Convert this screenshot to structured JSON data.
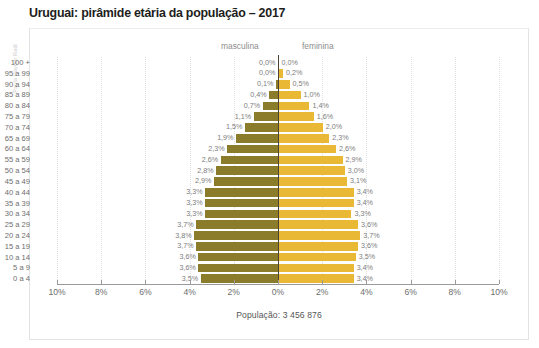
{
  "credit": "Paula Hayder Radi",
  "title": "Uruguai: pirâmide etária da população – 2017",
  "headers": {
    "male": "masculina",
    "female": "feminina"
  },
  "caption": "População: 3 456 876",
  "colors": {
    "male_bar": "#8a7c2b",
    "female_bar": "#e9b936",
    "centerline": "#4d4236",
    "axis": "#9a9a9a",
    "grid": "#e0e0e0",
    "title_text": "#1d1d1b",
    "label_text": "#6e6e6e"
  },
  "chart_data": {
    "type": "bar",
    "title": "Uruguai: pirâmide etária da população – 2017",
    "subtype": "population-pyramid",
    "xlabel": "",
    "ylabel": "",
    "xlim": [
      -10,
      10
    ],
    "grid": true,
    "legend_position": "top-center",
    "axis_ticks": [
      "10%",
      "8%",
      "6%",
      "4%",
      "2%",
      "0%",
      "2%",
      "4%",
      "6%",
      "8%",
      "10%"
    ],
    "axis_tick_values": [
      -10,
      -8,
      -6,
      -4,
      -2,
      0,
      2,
      4,
      6,
      8,
      10
    ],
    "categories": [
      "100 +",
      "95 a 99",
      "90 a 94",
      "85 a 89",
      "80 a 84",
      "75 a 79",
      "70 a 74",
      "65 a 69",
      "60 a 64",
      "55 a 59",
      "50 a 54",
      "45 a 49",
      "40 a 44",
      "35 a 39",
      "30 a 34",
      "25 a 29",
      "20 a 24",
      "15 a 19",
      "10 a 14",
      "5 a 9",
      "0 a 4"
    ],
    "series": [
      {
        "name": "masculina",
        "color": "#8a7c2b",
        "values": [
          0.0,
          0.0,
          0.1,
          0.4,
          0.7,
          1.1,
          1.5,
          1.9,
          2.3,
          2.6,
          2.8,
          2.9,
          3.3,
          3.3,
          3.3,
          3.7,
          3.8,
          3.7,
          3.6,
          3.6,
          3.5
        ],
        "labels": [
          "0,0%",
          "0,0%",
          "0,1%",
          "0,4%",
          "0,7%",
          "1,1%",
          "1,5%",
          "1,9%",
          "2,3%",
          "2,6%",
          "2,8%",
          "2,9%",
          "3,3%",
          "3,3%",
          "3,3%",
          "3,7%",
          "3,8%",
          "3,7%",
          "3,6%",
          "3,6%",
          "3,5%"
        ]
      },
      {
        "name": "feminina",
        "color": "#e9b936",
        "values": [
          0.0,
          0.2,
          0.5,
          1.0,
          1.4,
          1.6,
          2.0,
          2.3,
          2.6,
          2.9,
          3.0,
          3.1,
          3.4,
          3.4,
          3.3,
          3.6,
          3.7,
          3.6,
          3.5,
          3.4,
          3.4
        ],
        "labels": [
          "0,0%",
          "0,2%",
          "0,5%",
          "1,0%",
          "1,4%",
          "1,6%",
          "2,0%",
          "2,3%",
          "2,6%",
          "2,9%",
          "3,0%",
          "3,1%",
          "3,4%",
          "3,4%",
          "3,3%",
          "3,6%",
          "3,7%",
          "3,6%",
          "3,5%",
          "3,4%",
          "3,4%"
        ]
      }
    ],
    "annotations": [
      "População: 3 456 876"
    ]
  }
}
